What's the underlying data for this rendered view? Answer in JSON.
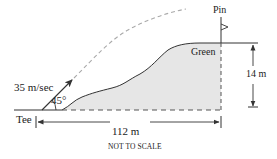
{
  "diagram": {
    "labels": {
      "velocity": "35 m/sec",
      "angle": "45°",
      "tee": "Tee",
      "pin": "Pin",
      "green": "Green",
      "height": "14 m",
      "distance": "112 m",
      "note": "NOT TO SCALE"
    },
    "values": {
      "initial_speed_m_per_s": 35,
      "launch_angle_deg": 45,
      "green_height_m": 14,
      "horizontal_distance_m": 112
    },
    "colors": {
      "line": "#333333",
      "trajectory": "#aaaaaa",
      "hill_fill": "#e6e6e6"
    }
  }
}
